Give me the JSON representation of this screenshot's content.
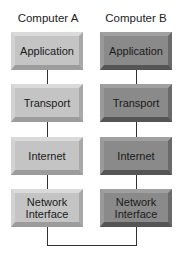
{
  "diagram": {
    "columns": [
      {
        "title": "Computer A",
        "layers": [
          "Application",
          "Transport",
          "Internet",
          "Network\nInterface"
        ]
      },
      {
        "title": "Computer B",
        "layers": [
          "Application",
          "Transport",
          "Internet",
          "Network\nInterface"
        ]
      }
    ],
    "colors": {
      "computer_a_box": "#c4c4c4",
      "computer_b_box": "#8a8a8a",
      "line": "#333333"
    }
  }
}
